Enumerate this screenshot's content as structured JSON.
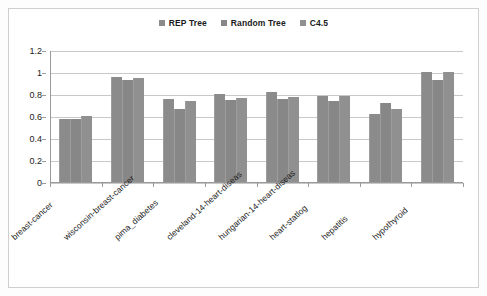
{
  "figure": {
    "background_color": "#ffffff",
    "border_color": "#cfcfcf"
  },
  "legend": {
    "position": "top-center",
    "entries": [
      {
        "label": "REP Tree",
        "color": "#8b8b8b"
      },
      {
        "label": "Random Tree",
        "color": "#878787"
      },
      {
        "label": "C4.5",
        "color": "#909090"
      }
    ]
  },
  "axis": {
    "y_ticks": [
      "1.2",
      "1",
      "0.8",
      "0.6",
      "0.4",
      "0.2",
      "0"
    ],
    "y_tick_values": [
      1.2,
      1,
      0.8,
      0.6,
      0.4,
      0.2,
      0
    ]
  },
  "chart_data": {
    "type": "bar",
    "title": "",
    "subtitle": "",
    "xlabel": "",
    "ylabel": "",
    "ylim": [
      0,
      1.2
    ],
    "grid": true,
    "legend_position": "top-center",
    "categories": [
      "breast-cancer",
      "wisconsin-breast-cancer",
      "pima_diabetes",
      "cleveland-14-heart-diseas",
      "hungarian-14-heart-diseas",
      "heart-statlog",
      "hepatitis",
      "hypothyroid"
    ],
    "series": [
      {
        "name": "REP Tree",
        "color": "#8b8b8b",
        "values": [
          0.58,
          0.96,
          0.76,
          0.81,
          0.83,
          0.79,
          0.63,
          1.005
        ]
      },
      {
        "name": "Random Tree",
        "color": "#878787",
        "values": [
          0.58,
          0.935,
          0.675,
          0.755,
          0.76,
          0.75,
          0.73,
          0.94
        ]
      },
      {
        "name": "C4.5",
        "color": "#909090",
        "values": [
          0.605,
          0.955,
          0.75,
          0.77,
          0.78,
          0.79,
          0.675,
          1.005
        ]
      }
    ]
  }
}
